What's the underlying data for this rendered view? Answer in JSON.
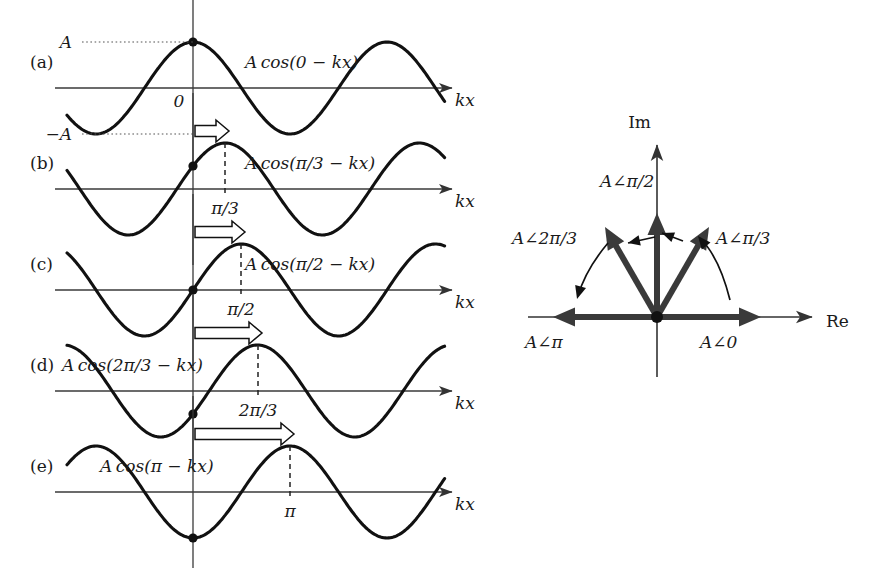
{
  "figure": {
    "axis_label_x": "kx",
    "amplitude_pos_label": "A",
    "amplitude_neg_label": "−A",
    "origin_label": "0"
  },
  "panels": [
    {
      "tag": "(a)",
      "expression": "A cos(0 − kx)",
      "phase_label": "",
      "phase_radians": 0,
      "shift_px": 0,
      "marker": "peak",
      "has_block_arrow": false,
      "has_dashed_line": false,
      "axis_y": 88
    },
    {
      "tag": "(b)",
      "expression": "A cos(π/3 − kx)",
      "phase_label": "π/3",
      "phase_radians": 1.0472,
      "shift_px": 32,
      "marker": "rising",
      "has_block_arrow": true,
      "has_dashed_line": true,
      "axis_y": 189
    },
    {
      "tag": "(c)",
      "expression": "A cos(π/2 − kx)",
      "phase_label": "π/2",
      "phase_radians": 1.5708,
      "shift_px": 48,
      "marker": "zero",
      "has_block_arrow": true,
      "has_dashed_line": true,
      "axis_y": 290
    },
    {
      "tag": "(d)",
      "expression": "A cos(2π/3 − kx)",
      "phase_label": "2π/3",
      "phase_radians": 2.0944,
      "shift_px": 65,
      "marker": "falling",
      "has_block_arrow": true,
      "has_dashed_line": true,
      "axis_y": 391
    },
    {
      "tag": "(e)",
      "expression": "A cos(π − kx)",
      "phase_label": "π",
      "phase_radians": 3.1416,
      "shift_px": 97,
      "marker": "trough",
      "has_block_arrow": true,
      "has_dashed_line": true,
      "axis_y": 492
    }
  ],
  "phasor_diagram": {
    "axis_im_label": "Im",
    "axis_re_label": "Re",
    "phasors": [
      {
        "label": "A∠0",
        "angle_deg": 0,
        "label_x": 700,
        "label_y": 348
      },
      {
        "label": "A∠π/3",
        "angle_deg": 60,
        "label_x": 716,
        "label_y": 244
      },
      {
        "label": "A∠π/2",
        "angle_deg": 90,
        "label_x": 600,
        "label_y": 187
      },
      {
        "label": "A∠2π/3",
        "angle_deg": 120,
        "label_x": 512,
        "label_y": 244
      },
      {
        "label": "A∠π",
        "angle_deg": 180,
        "label_x": 525,
        "label_y": 348
      }
    ]
  },
  "chart_data": {
    "type": "line",
    "xlabel": "kx",
    "ylabel": "",
    "series": [
      {
        "name": "A cos(0 − kx)",
        "phase": 0.0,
        "amplitude": "A",
        "value_at_origin": "A"
      },
      {
        "name": "A cos(π/3 − kx)",
        "phase": 1.0472,
        "amplitude": "A",
        "value_at_origin": "A/2"
      },
      {
        "name": "A cos(π/2 − kx)",
        "phase": 1.5708,
        "amplitude": "A",
        "value_at_origin": "0"
      },
      {
        "name": "A cos(2π/3 − kx)",
        "phase": 2.0944,
        "amplitude": "A",
        "value_at_origin": "−A/2"
      },
      {
        "name": "A cos(π − kx)",
        "phase": 3.1416,
        "amplitude": "A",
        "value_at_origin": "−A"
      }
    ],
    "ytick_labels": [
      "A",
      "0",
      "−A"
    ],
    "ylim": [
      "−A",
      "A"
    ],
    "grid": false,
    "legend": "none"
  }
}
